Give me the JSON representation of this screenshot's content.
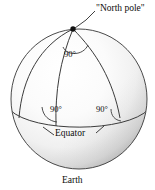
{
  "figure": {
    "caption": "Earth",
    "labels": {
      "north_pole": "\"North pole\"",
      "equator": "Equator",
      "earth": "Earth"
    },
    "angles": {
      "top": "90°",
      "left": "90°",
      "right": "90°"
    },
    "colors": {
      "outline": "#3a3a3a",
      "text": "#0d0d0d",
      "sphere_light": "#ffffff",
      "sphere_mid": "#f2f2f2",
      "sphere_shadow": "#b9b9b9",
      "background": "#ffffff",
      "pole_dot": "#111111"
    },
    "geometry": {
      "sphere_center_x": 79,
      "sphere_center_y": 99,
      "sphere_radius_x": 68,
      "sphere_radius_y": 70,
      "north_pole_x": 73,
      "north_pole_y": 29
    }
  }
}
